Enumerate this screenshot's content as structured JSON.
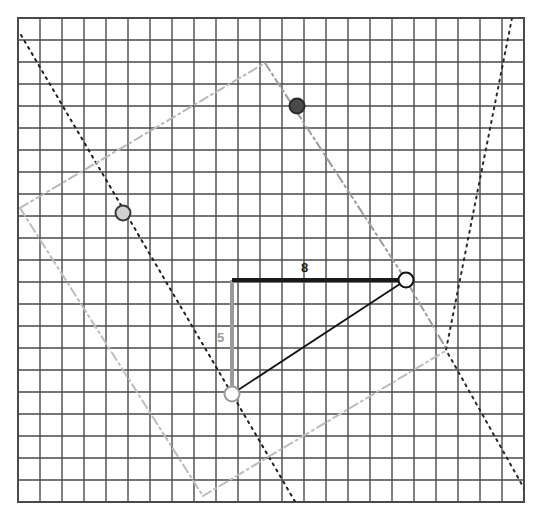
{
  "diagram": {
    "type": "geometry-grid",
    "background_color": "#ffffff"
  },
  "grid": {
    "name": "square-grid",
    "x0": 18,
    "y0": 18,
    "cols": 23,
    "rows": 22,
    "cell": 22,
    "line_color": "#4a4a4a",
    "line_width": 1.4,
    "border_color": "#4a4a4a",
    "border_width": 2
  },
  "labels": {
    "base_length": "8",
    "height_length": "5",
    "base_label_color": "#1a1a1a",
    "height_label_color": "#9a9a9a",
    "base_label_x": 301,
    "base_label_y": 261,
    "height_label_x": 217,
    "height_label_y": 331
  },
  "triangle": {
    "name": "right-triangle",
    "vertices": [
      {
        "name": "right-angle-corner",
        "x": 232,
        "y": 280
      },
      {
        "name": "upper-right-vertex",
        "x": 406,
        "y": 280
      },
      {
        "name": "lower-left-vertex",
        "x": 232,
        "y": 394
      }
    ],
    "hypotenuse_color": "#111111",
    "hypotenuse_width": 1.8,
    "base_color": "#1a1a1a",
    "base_width": 4,
    "height_color": "#9a9a9a",
    "height_width": 4
  },
  "markers": [
    {
      "name": "vertex-marker-upper-right",
      "x": 406,
      "y": 280,
      "r": 7.5,
      "fill": "#ffffff",
      "stroke": "#111111",
      "stroke_width": 2
    },
    {
      "name": "vertex-marker-lower-left",
      "x": 232,
      "y": 394,
      "r": 7.5,
      "fill": "#ffffff",
      "stroke": "#9a9a9a",
      "stroke_width": 2
    },
    {
      "name": "point-marker-light",
      "x": 123,
      "y": 213,
      "r": 7.5,
      "fill": "#d0d0d0",
      "stroke": "#3a3a3a",
      "stroke_width": 2
    },
    {
      "name": "point-marker-dark",
      "x": 297,
      "y": 106,
      "r": 7.5,
      "fill": "#4a4a4a",
      "stroke": "#2a2a2a",
      "stroke_width": 2
    }
  ],
  "lines": {
    "dotted_black": {
      "name": "dotted-transversal-line",
      "points": [
        [
          21,
          35
        ],
        [
          232,
          394
        ],
        [
          300,
          510
        ]
      ],
      "color": "#1f1f1f",
      "width": 2,
      "dash": "2,5"
    },
    "dashdot_gray_a": {
      "name": "dashdot-line-ascending",
      "points": [
        [
          20,
          208
        ],
        [
          265,
          63
        ]
      ],
      "color": "#b9b9b9",
      "width": 2,
      "dash": "9,4,2,4"
    },
    "dashdot_gray_b": {
      "name": "dashdot-line-descending-right",
      "points": [
        [
          265,
          63
        ],
        [
          406,
          280
        ],
        [
          447,
          350
        ]
      ],
      "color": "#9d9d9d",
      "width": 2,
      "dash": "9,4,2,4"
    },
    "dashdot_gray_c": {
      "name": "dashdot-line-descending-left",
      "points": [
        [
          20,
          208
        ],
        [
          203,
          496
        ]
      ],
      "color": "#bdbdbd",
      "width": 2,
      "dash": "9,4,2,4"
    },
    "dashdot_gray_d": {
      "name": "dashdot-line-bottom-right",
      "points": [
        [
          203,
          496
        ],
        [
          447,
          350
        ]
      ],
      "color": "#bdbdbd",
      "width": 2,
      "dash": "9,4,2,4"
    },
    "dotted_black_upper": {
      "name": "dotted-line-top-right-corner",
      "points": [
        [
          512,
          18
        ],
        [
          446,
          350
        ],
        [
          525,
          490
        ]
      ],
      "color": "#2a2a2a",
      "width": 2,
      "dash": "2,5"
    }
  },
  "chart_data": {
    "type": "scatter",
    "xlabel": "",
    "ylabel": "",
    "categories": [
      "base",
      "height",
      "hypotenuse"
    ],
    "values": [
      8,
      5,
      9.434
    ],
    "annotations": [
      "8",
      "5"
    ]
  }
}
